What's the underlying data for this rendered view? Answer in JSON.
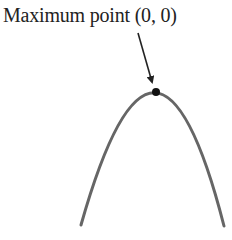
{
  "annotation": {
    "text": "Maximum point (0, 0)"
  },
  "diagram": {
    "type": "parabola",
    "orientation": "downward",
    "vertex": {
      "x": 0,
      "y": 0,
      "marked": true
    },
    "curve_color": "#666666",
    "point_color": "#111111",
    "arrow_color": "#222222"
  }
}
